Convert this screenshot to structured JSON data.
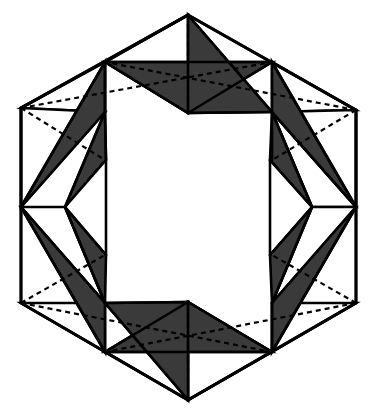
{
  "figure": {
    "title": "Hexagonal star folding net",
    "background_color": "#ffffff",
    "shade_color": "#3a3a3a",
    "stroke_color": "#000000",
    "unshaded_color": "#ffffff",
    "solid_stroke_width": 2.6,
    "dash_stroke_width": 2.2,
    "dash_pattern": "5,4",
    "symmetry_order": 6,
    "center": {
      "x": 188.5,
      "y": 207.5
    },
    "hexagon_vertices": [
      {
        "x": 188,
        "y": 15
      },
      {
        "x": 356,
        "y": 110
      },
      {
        "x": 356,
        "y": 303
      },
      {
        "x": 188,
        "y": 400
      },
      {
        "x": 21,
        "y": 303
      },
      {
        "x": 21,
        "y": 108
      }
    ],
    "star_inner_vertices": [
      {
        "x": 188,
        "y": 113
      },
      {
        "x": 270,
        "y": 160
      },
      {
        "x": 270,
        "y": 255
      },
      {
        "x": 188,
        "y": 302
      },
      {
        "x": 106,
        "y": 255
      },
      {
        "x": 106,
        "y": 160
      }
    ],
    "star_outer_vertices": [
      {
        "x": 272,
        "y": 112
      },
      {
        "x": 312,
        "y": 207
      },
      {
        "x": 272,
        "y": 303
      },
      {
        "x": 105,
        "y": 303
      },
      {
        "x": 65,
        "y": 207
      },
      {
        "x": 105,
        "y": 112
      }
    ],
    "midpoints": [
      {
        "x": 272,
        "y": 62
      },
      {
        "x": 356,
        "y": 207
      },
      {
        "x": 272,
        "y": 352
      },
      {
        "x": 105,
        "y": 352
      },
      {
        "x": 21,
        "y": 207
      },
      {
        "x": 105,
        "y": 62
      }
    ],
    "shaded_triangle_count": 6,
    "unshaded_triangle_count": 12,
    "fold_line_count": 12
  },
  "chart_data": {
    "type": "diagram",
    "title": "Hexagonal star folding net",
    "series": [
      {
        "name": "shaded-triangles",
        "fill": "#3a3a3a",
        "polygons": [
          [
            [
              105,
              62
            ],
            [
              272,
              62
            ],
            [
              188,
              113
            ]
          ],
          [
            [
              188,
              15
            ],
            [
              272,
              112
            ],
            [
              188,
              113
            ]
          ],
          [
            [
              272,
              62
            ],
            [
              356,
              207
            ],
            [
              272,
              112
            ]
          ],
          [
            [
              272,
              112
            ],
            [
              312,
              207
            ],
            [
              270,
              160
            ]
          ],
          [
            [
              356,
              207
            ],
            [
              272,
              352
            ],
            [
              272,
              303
            ]
          ],
          [
            [
              270,
              255
            ],
            [
              312,
              207
            ],
            [
              272,
              303
            ]
          ],
          [
            [
              272,
              352
            ],
            [
              105,
              352
            ],
            [
              188,
              302
            ]
          ],
          [
            [
              188,
              400
            ],
            [
              105,
              303
            ],
            [
              188,
              302
            ]
          ],
          [
            [
              105,
              352
            ],
            [
              21,
              207
            ],
            [
              105,
              303
            ]
          ],
          [
            [
              105,
              303
            ],
            [
              65,
              207
            ],
            [
              106,
              255
            ]
          ],
          [
            [
              21,
              207
            ],
            [
              105,
              62
            ],
            [
              105,
              112
            ]
          ],
          [
            [
              106,
              160
            ],
            [
              65,
              207
            ],
            [
              105,
              112
            ]
          ]
        ]
      },
      {
        "name": "unshaded-triangles",
        "fill": "#ffffff",
        "polygons": [
          [
            [
              188,
              15
            ],
            [
              105,
              62
            ],
            [
              188,
              113
            ]
          ],
          [
            [
              105,
              62
            ],
            [
              21,
              108
            ],
            [
              105,
              112
            ]
          ],
          [
            [
              272,
              62
            ],
            [
              356,
              110
            ],
            [
              272,
              112
            ]
          ],
          [
            [
              272,
              112
            ],
            [
              356,
              207
            ],
            [
              312,
              207
            ]
          ],
          [
            [
              21,
              108
            ],
            [
              21,
              207
            ],
            [
              105,
              112
            ]
          ],
          [
            [
              356,
              110
            ],
            [
              356,
              207
            ],
            [
              272,
              112
            ]
          ],
          [
            [
              65,
              207
            ],
            [
              21,
              207
            ],
            [
              105,
              303
            ]
          ],
          [
            [
              312,
              207
            ],
            [
              356,
              207
            ],
            [
              272,
              303
            ]
          ],
          [
            [
              272,
              303
            ],
            [
              356,
              303
            ],
            [
              272,
              352
            ]
          ],
          [
            [
              105,
              303
            ],
            [
              21,
              303
            ],
            [
              105,
              352
            ]
          ],
          [
            [
              188,
              302
            ],
            [
              272,
              352
            ],
            [
              188,
              400
            ]
          ],
          [
            [
              105,
              352
            ],
            [
              188,
              400
            ],
            [
              188,
              302
            ]
          ]
        ]
      },
      {
        "name": "fold-lines-dashed",
        "stroke": "#000000",
        "segments": [
          [
            [
              188,
              15
            ],
            [
              188,
              113
            ]
          ],
          [
            [
              21,
              108
            ],
            [
              105,
              160
            ]
          ],
          [
            [
              21,
              108
            ],
            [
              272,
              62
            ]
          ],
          [
            [
              356,
              110
            ],
            [
              272,
              160
            ]
          ],
          [
            [
              356,
              110
            ],
            [
              105,
              62
            ]
          ],
          [
            [
              21,
              303
            ],
            [
              105,
              255
            ]
          ],
          [
            [
              21,
              303
            ],
            [
              272,
              352
            ]
          ],
          [
            [
              356,
              303
            ],
            [
              272,
              255
            ]
          ],
          [
            [
              356,
              303
            ],
            [
              105,
              352
            ]
          ],
          [
            [
              188,
              400
            ],
            [
              188,
              302
            ]
          ],
          [
            [
              65,
              207
            ],
            [
              105,
              160
            ]
          ],
          [
            [
              312,
              207
            ],
            [
              270,
              255
            ]
          ]
        ]
      },
      {
        "name": "solid-lines",
        "stroke": "#000000",
        "segments": [
          [
            [
              188,
              15
            ],
            [
              356,
              110
            ]
          ],
          [
            [
              356,
              110
            ],
            [
              356,
              303
            ]
          ],
          [
            [
              356,
              303
            ],
            [
              188,
              400
            ]
          ],
          [
            [
              188,
              400
            ],
            [
              21,
              303
            ]
          ],
          [
            [
              21,
              303
            ],
            [
              21,
              108
            ]
          ],
          [
            [
              21,
              108
            ],
            [
              188,
              15
            ]
          ],
          [
            [
              188,
              15
            ],
            [
              105,
              62
            ]
          ],
          [
            [
              105,
              62
            ],
            [
              272,
              62
            ]
          ],
          [
            [
              272,
              62
            ],
            [
              188,
              113
            ]
          ],
          [
            [
              188,
              113
            ],
            [
              105,
              62
            ]
          ],
          [
            [
              188,
              15
            ],
            [
              272,
              112
            ]
          ],
          [
            [
              272,
              112
            ],
            [
              188,
              113
            ]
          ],
          [
            [
              272,
              62
            ],
            [
              356,
              207
            ]
          ],
          [
            [
              356,
              207
            ],
            [
              272,
              112
            ]
          ],
          [
            [
              272,
              112
            ],
            [
              312,
              207
            ]
          ],
          [
            [
              312,
              207
            ],
            [
              270,
              160
            ]
          ],
          [
            [
              270,
              160
            ],
            [
              270,
              255
            ]
          ],
          [
            [
              270,
              255
            ],
            [
              312,
              207
            ]
          ],
          [
            [
              356,
              207
            ],
            [
              272,
              352
            ]
          ],
          [
            [
              272,
              352
            ],
            [
              272,
              303
            ]
          ],
          [
            [
              272,
              303
            ],
            [
              312,
              207
            ]
          ],
          [
            [
              272,
              352
            ],
            [
              105,
              352
            ]
          ],
          [
            [
              105,
              352
            ],
            [
              188,
              302
            ]
          ],
          [
            [
              188,
              302
            ],
            [
              272,
              352
            ]
          ],
          [
            [
              188,
              400
            ],
            [
              105,
              303
            ]
          ],
          [
            [
              105,
              303
            ],
            [
              188,
              302
            ]
          ],
          [
            [
              105,
              352
            ],
            [
              21,
              207
            ]
          ],
          [
            [
              21,
              207
            ],
            [
              105,
              303
            ]
          ],
          [
            [
              105,
              303
            ],
            [
              65,
              207
            ]
          ],
          [
            [
              65,
              207
            ],
            [
              106,
              255
            ]
          ],
          [
            [
              106,
              255
            ],
            [
              106,
              160
            ]
          ],
          [
            [
              21,
              207
            ],
            [
              105,
              62
            ]
          ],
          [
            [
              105,
              62
            ],
            [
              105,
              112
            ]
          ],
          [
            [
              105,
              112
            ],
            [
              65,
              207
            ]
          ],
          [
            [
              105,
              112
            ],
            [
              106,
              160
            ]
          ],
          [
            [
              272,
              112
            ],
            [
              272,
              160
            ]
          ]
        ]
      }
    ]
  }
}
